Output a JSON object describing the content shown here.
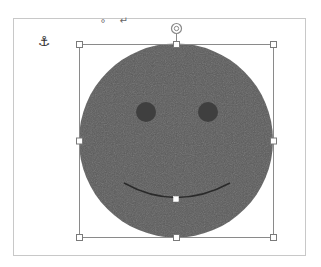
{
  "document": {
    "anchor_icon": "⚓",
    "paragraph_marks": "∘ ↵"
  },
  "shape": {
    "type": "smiley-face",
    "fill_color": "#5c5c5c",
    "eye_color": "#3f3f3f",
    "mouth_color": "#2e2e2e",
    "selection_color": "#8a8a8a",
    "handles": [
      "top-left",
      "top",
      "top-right",
      "left",
      "right",
      "bottom-left",
      "bottom",
      "bottom-right"
    ],
    "rotation_handle": "rotate-icon",
    "adjustment_handle": "smile-adjust"
  }
}
